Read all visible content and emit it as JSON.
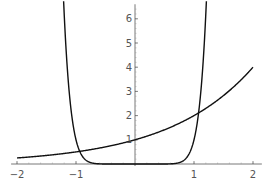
{
  "chart_data": {
    "type": "line",
    "title": "",
    "xlabel": "",
    "ylabel": "",
    "xlim": [
      -2.1,
      2.15
    ],
    "ylim": [
      0,
      6.6
    ],
    "grid": false,
    "legend": null,
    "x_ticks": [
      -2,
      -1,
      1,
      2
    ],
    "x_tick_labels": [
      "-2",
      "-1",
      "1",
      "2"
    ],
    "y_ticks": [
      1,
      2,
      3,
      4,
      5,
      6
    ],
    "y_tick_labels": [
      "1",
      "2",
      "3",
      "4",
      "5",
      "6"
    ],
    "series": [
      {
        "name": "2^x",
        "color": "#111111",
        "x": [
          -2,
          -1.5,
          -1,
          -0.5,
          0,
          0.5,
          1,
          1.5,
          2
        ],
        "y": [
          0.25,
          0.35,
          0.5,
          0.71,
          1,
          1.41,
          2,
          2.83,
          4
        ]
      },
      {
        "name": "x^10",
        "color": "#111111",
        "x": [
          -1.21,
          -1.15,
          -1.1,
          -1.05,
          -1,
          -0.95,
          -0.9,
          -0.8,
          -0.7,
          0,
          0.7,
          0.8,
          0.9,
          0.95,
          1,
          1.05,
          1.1,
          1.15,
          1.21
        ],
        "y": [
          6.7,
          4.05,
          2.59,
          1.63,
          1,
          0.6,
          0.35,
          0.11,
          0.03,
          0,
          0.03,
          0.11,
          0.35,
          0.6,
          1,
          1.63,
          2.59,
          4.05,
          6.7
        ]
      }
    ]
  },
  "axes": {
    "x_labels": [
      "-2",
      "-1",
      "1",
      "2"
    ],
    "y_labels": [
      "1",
      "2",
      "3",
      "4",
      "5",
      "6"
    ]
  }
}
